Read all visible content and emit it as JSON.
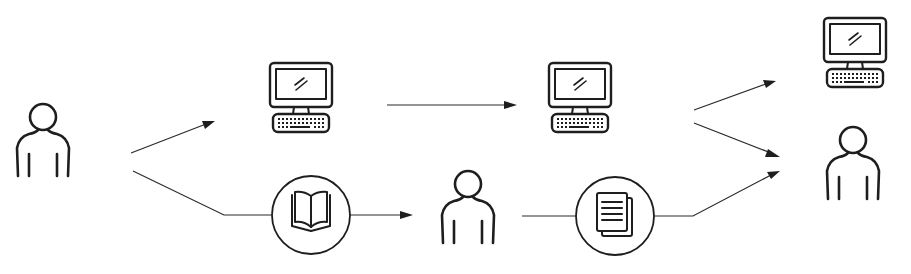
{
  "diagram": {
    "type": "flow",
    "nodes": [
      {
        "id": "person-source",
        "icon": "person-icon"
      },
      {
        "id": "computer-1",
        "icon": "computer-icon"
      },
      {
        "id": "computer-2",
        "icon": "computer-icon"
      },
      {
        "id": "computer-3",
        "icon": "computer-icon"
      },
      {
        "id": "book",
        "icon": "book-icon",
        "enclosed_in_circle": true
      },
      {
        "id": "person-middle",
        "icon": "person-icon"
      },
      {
        "id": "document",
        "icon": "document-icon",
        "enclosed_in_circle": true
      },
      {
        "id": "person-target",
        "icon": "person-icon"
      }
    ],
    "edges": [
      {
        "from": "person-source",
        "to": "computer-1",
        "arrow": true
      },
      {
        "from": "computer-1",
        "to": "computer-2",
        "arrow": true
      },
      {
        "from": "computer-2",
        "to": "computer-3",
        "arrow": true
      },
      {
        "from": "computer-2",
        "to": "person-target",
        "arrow": true
      },
      {
        "from": "person-source",
        "to": "book",
        "arrow": false
      },
      {
        "from": "book",
        "to": "person-middle",
        "arrow": true
      },
      {
        "from": "person-middle",
        "to": "document",
        "arrow": false
      },
      {
        "from": "document",
        "to": "person-target",
        "arrow": true
      }
    ],
    "colors": {
      "line": "#1e1e1e",
      "background": "#ffffff"
    }
  }
}
